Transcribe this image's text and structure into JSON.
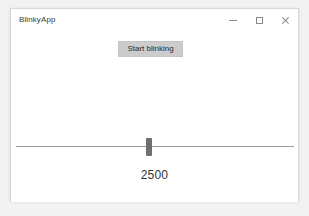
{
  "window": {
    "title": "BlinkyApp",
    "background_color": "#ffffff",
    "border_color": "#d8d8d8",
    "controls": {
      "minimize": {
        "label": "—",
        "icon": "minimize-icon"
      },
      "maximize": {
        "label": "□",
        "icon": "maximize-icon"
      },
      "close": {
        "label": "✕",
        "icon": "close-icon"
      }
    }
  },
  "desktop": {
    "background_color": "#f2f2f2"
  },
  "main": {
    "button": {
      "label": "Start blinking",
      "background_color": "#cccccc",
      "text_color": "#2b2b2b"
    },
    "slider": {
      "value": 2500,
      "thumb_color": "#6f6f6f",
      "track_color": "#9a9a9a",
      "thumb_position_percent": 48
    },
    "value_label": "2500"
  }
}
